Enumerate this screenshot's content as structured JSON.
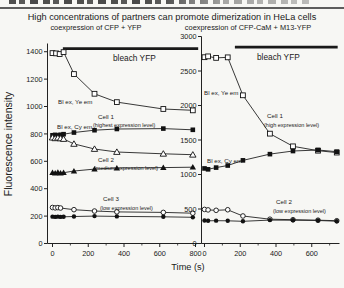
{
  "figure": {
    "title": "High concentrations of partners can promote dimerization in HeLa cells",
    "xlabel": "Time (s)",
    "ylabel": "Fluorescence intensity"
  },
  "colors": {
    "ink": "#1a1a1a",
    "axis": "#222222",
    "marker_fill": "#111111",
    "open_marker_fill": "#ffffff",
    "background": "#f7f7f4"
  },
  "chart_data": [
    {
      "type": "line",
      "title": "coexpression of CFP + YFP",
      "xlabel": "Time (s)",
      "ylabel": "Fluorescence intensity",
      "xlim": [
        0,
        830
      ],
      "ylim": [
        0,
        1460
      ],
      "grid": false,
      "legend_position": "in-plot annotations",
      "xticks": [
        0,
        200,
        400,
        600,
        800
      ],
      "xminorticks": [
        100,
        300,
        500,
        700
      ],
      "yticks": [
        0,
        200,
        400,
        600,
        800,
        1000,
        1200,
        1400
      ],
      "bleach_bar": {
        "label": "bleach YFP",
        "t1": 58,
        "t2": 815,
        "value": 1422
      },
      "series": [
        {
          "cell": "Cell 1 (highest expression level)",
          "signal": "Bl ex, Ye em",
          "marker": "square-open",
          "points": [
            [
              0,
              1390
            ],
            [
              20,
              1388
            ],
            [
              40,
              1383
            ],
            [
              62,
              1397
            ],
            [
              120,
              1237
            ],
            [
              235,
              1093
            ],
            [
              360,
              1032
            ],
            [
              620,
              982
            ],
            [
              785,
              972
            ]
          ]
        },
        {
          "cell": "Cell 1 (highest expression level)",
          "signal": "Bl ex, Cy em",
          "marker": "square-filled",
          "points": [
            [
              0,
              790
            ],
            [
              15,
              793
            ],
            [
              30,
              789
            ],
            [
              45,
              794
            ],
            [
              62,
              798
            ],
            [
              120,
              810
            ],
            [
              235,
              827
            ],
            [
              360,
              836
            ],
            [
              620,
              839
            ],
            [
              785,
              830
            ]
          ]
        },
        {
          "cell": "Cell 2 (medium expression level)",
          "signal": "Bl ex, Ye em",
          "marker": "triangle-open",
          "points": [
            [
              0,
              773
            ],
            [
              15,
              768
            ],
            [
              30,
              772
            ],
            [
              45,
              767
            ],
            [
              62,
              763
            ],
            [
              120,
              727
            ],
            [
              235,
              690
            ],
            [
              360,
              668
            ],
            [
              620,
              655
            ],
            [
              785,
              648
            ]
          ]
        },
        {
          "cell": "Cell 2 (medium expression level)",
          "signal": "Bl ex, Cy em",
          "marker": "triangle-filled",
          "points": [
            [
              0,
              518
            ],
            [
              15,
              514
            ],
            [
              30,
              519
            ],
            [
              45,
              514
            ],
            [
              62,
              517
            ],
            [
              120,
              529
            ],
            [
              235,
              543
            ],
            [
              360,
              551
            ],
            [
              620,
              554
            ],
            [
              785,
              557
            ]
          ]
        },
        {
          "cell": "Cell 3 (low expression level)",
          "signal": "Bl ex, Ye em",
          "marker": "circle-open",
          "points": [
            [
              0,
              263
            ],
            [
              15,
              260
            ],
            [
              30,
              262
            ],
            [
              45,
              259
            ],
            [
              120,
              247
            ],
            [
              235,
              237
            ],
            [
              360,
              231
            ],
            [
              620,
              227
            ],
            [
              785,
              221
            ]
          ]
        },
        {
          "cell": "Cell 3 (low expression level)",
          "signal": "Bl ex, Cy em",
          "marker": "circle-filled",
          "points": [
            [
              0,
              196
            ],
            [
              15,
              194
            ],
            [
              30,
              196
            ],
            [
              45,
              194
            ],
            [
              62,
              195
            ],
            [
              120,
              197
            ],
            [
              235,
              200
            ],
            [
              360,
              198
            ],
            [
              620,
              195
            ],
            [
              785,
              191
            ]
          ]
        }
      ],
      "annotations": [
        {
          "text": "bleach YFP",
          "x": 113,
          "y": 29,
          "fs": 8.3
        },
        {
          "text": "Bl ex, Ye em",
          "x": 58,
          "y": 72,
          "fs": 6.2
        },
        {
          "text": "Cell 1",
          "x": 98,
          "y": 87,
          "fs": 6.2
        },
        {
          "text": "(highest expression level)",
          "x": 93,
          "y": 95,
          "fs": 5.5
        },
        {
          "text": "Bl ex, Cy em",
          "x": 57,
          "y": 97,
          "fs": 6.2
        },
        {
          "text": "Cell 2",
          "x": 98,
          "y": 130,
          "fs": 6.2
        },
        {
          "text": "(medium expression level)",
          "x": 94,
          "y": 138,
          "fs": 5.5
        },
        {
          "text": "Cell 3",
          "x": 103,
          "y": 169,
          "fs": 6.2
        },
        {
          "text": "(low expression level)",
          "x": 100,
          "y": 178,
          "fs": 5.5
        }
      ]
    },
    {
      "type": "line",
      "title": "coexpression of CFP-CaM + M13-YFP",
      "xlabel": "Time (s)",
      "ylabel": "Fluorescence intensity",
      "xlim": [
        0,
        760
      ],
      "ylim": [
        0,
        3000
      ],
      "grid": false,
      "legend_position": "in-plot annotations",
      "xticks": [
        0,
        200,
        400,
        600
      ],
      "xminorticks": [
        100,
        300,
        500,
        700
      ],
      "yticks": [
        0,
        500,
        1000,
        1500,
        2000,
        2500,
        3000
      ],
      "bleach_bar": {
        "label": "bleach YFP",
        "t1": 170,
        "t2": 745,
        "value": 2845
      },
      "series": [
        {
          "cell": "Cell 1 (high expression level)",
          "signal": "Bl ex, Ye em",
          "marker": "square-open",
          "points": [
            [
              0,
              2700
            ],
            [
              20,
              2712
            ],
            [
              65,
              2690
            ],
            [
              130,
              2698
            ],
            [
              215,
              2148
            ],
            [
              366,
              1592
            ],
            [
              495,
              1408
            ],
            [
              635,
              1345
            ],
            [
              740,
              1318
            ]
          ]
        },
        {
          "cell": "Cell 1 (high expression level)",
          "signal": "Bl ex, Cy em",
          "marker": "square-filled",
          "points": [
            [
              0,
              1088
            ],
            [
              20,
              1075
            ],
            [
              65,
              1100
            ],
            [
              130,
              1130
            ],
            [
              215,
              1205
            ],
            [
              366,
              1295
            ],
            [
              495,
              1340
            ],
            [
              635,
              1355
            ],
            [
              740,
              1330
            ]
          ]
        },
        {
          "cell": "Cell 2 (low expression level)",
          "signal": "Bl ex, Ye em",
          "marker": "circle-open",
          "points": [
            [
              0,
              494
            ],
            [
              20,
              487
            ],
            [
              65,
              481
            ],
            [
              130,
              489
            ],
            [
              215,
              399
            ],
            [
              366,
              352
            ],
            [
              495,
              345
            ],
            [
              635,
              338
            ],
            [
              740,
              330
            ]
          ]
        },
        {
          "cell": "Cell 2 (low expression level)",
          "signal": "Bl ex, Cy em",
          "marker": "circle-filled",
          "points": [
            [
              0,
              334
            ],
            [
              20,
              329
            ],
            [
              65,
              331
            ],
            [
              130,
              329
            ],
            [
              215,
              322
            ],
            [
              366,
              339
            ],
            [
              495,
              337
            ],
            [
              635,
              334
            ],
            [
              740,
              323
            ]
          ]
        }
      ],
      "annotations": [
        {
          "text": "bleach YFP",
          "x": 257,
          "y": 28,
          "fs": 8.3
        },
        {
          "text": "Bl ex, Ye em",
          "x": 204,
          "y": 63,
          "fs": 6.2
        },
        {
          "text": "Cell 1",
          "x": 267,
          "y": 86,
          "fs": 6.2
        },
        {
          "text": "(high expression level)",
          "x": 264,
          "y": 95,
          "fs": 5.5
        },
        {
          "text": "Bl ex, Cy em",
          "x": 207,
          "y": 131,
          "fs": 6.2
        },
        {
          "text": "Cell 2",
          "x": 276,
          "y": 172,
          "fs": 6.2
        },
        {
          "text": "(low expression level)",
          "x": 273,
          "y": 181,
          "fs": 5.5
        }
      ]
    }
  ]
}
